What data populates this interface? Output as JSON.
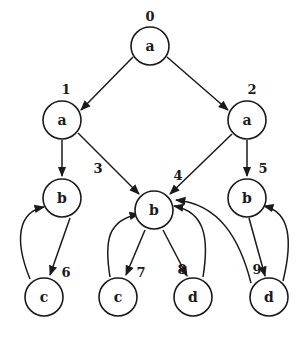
{
  "diagram": {
    "type": "directed-graph",
    "colors": {
      "stroke": "#1a1a1a",
      "background": "#ffffff",
      "node_fill": "#ffffff"
    },
    "nodes": [
      {
        "id": "0",
        "label": "a",
        "x": 150,
        "y": 46,
        "idx": 150,
        "idy": 16
      },
      {
        "id": "1",
        "label": "a",
        "x": 62,
        "y": 120,
        "idx": 66,
        "idy": 89
      },
      {
        "id": "2",
        "label": "a",
        "x": 247,
        "y": 120,
        "idx": 252,
        "idy": 89
      },
      {
        "id": "3",
        "label": "b",
        "x": 62,
        "y": 198,
        "idx": 98,
        "idy": 168
      },
      {
        "id": "4",
        "label": "b",
        "x": 154,
        "y": 210,
        "idx": 178,
        "idy": 175
      },
      {
        "id": "5",
        "label": "b",
        "x": 247,
        "y": 198,
        "idx": 263,
        "idy": 168
      },
      {
        "id": "6",
        "label": "c",
        "x": 44,
        "y": 297,
        "idx": 66,
        "idy": 272
      },
      {
        "id": "7",
        "label": "c",
        "x": 118,
        "y": 297,
        "idx": 141,
        "idy": 272
      },
      {
        "id": "8",
        "label": "d",
        "x": 193,
        "y": 297,
        "idx": 182,
        "idy": 269
      },
      {
        "id": "9",
        "label": "d",
        "x": 269,
        "y": 297,
        "idx": 257,
        "idy": 269
      }
    ],
    "edges": [
      {
        "from": "0",
        "to": "1",
        "path": "M133,57 L81,110"
      },
      {
        "from": "0",
        "to": "2",
        "path": "M167,57 L228,110"
      },
      {
        "from": "1",
        "to": "3",
        "path": "M62,140 L62,176"
      },
      {
        "from": "1",
        "to": "4",
        "path": "M78,133 L139,194"
      },
      {
        "from": "2",
        "to": "4",
        "path": "M232,134 L170,194"
      },
      {
        "from": "2",
        "to": "5",
        "path": "M247,140 L247,176"
      },
      {
        "from": "3",
        "to": "6",
        "path": "M70,218 L50,275"
      },
      {
        "from": "6",
        "to": "3",
        "path": "M30,279 C14,240 18,212 44,207"
      },
      {
        "from": "4",
        "to": "7",
        "path": "M145,230 L126,275"
      },
      {
        "from": "7",
        "to": "4",
        "path": "M110,277 C104,240 108,220 139,214"
      },
      {
        "from": "4",
        "to": "8",
        "path": "M163,230 L187,276"
      },
      {
        "from": "8",
        "to": "4",
        "path": "M203,277 C209,240 206,212 174,206"
      },
      {
        "from": "9",
        "to": "4",
        "path": "M251,283 C240,240 220,204 176,200"
      },
      {
        "from": "5",
        "to": "9",
        "path": "M249,218 L265,276"
      },
      {
        "from": "9",
        "to": "5",
        "path": "M283,281 C293,240 290,212 264,206"
      }
    ]
  }
}
